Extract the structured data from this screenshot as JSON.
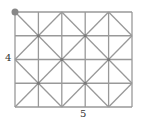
{
  "diagram": {
    "type": "grid-with-diagonals",
    "columns": 5,
    "rows": 4,
    "width_label": "5",
    "height_label": "4",
    "line_color": "#999999",
    "dot_color": "#777777",
    "start_marker_color": "#888888",
    "start_marker_position": "top-left corner"
  }
}
